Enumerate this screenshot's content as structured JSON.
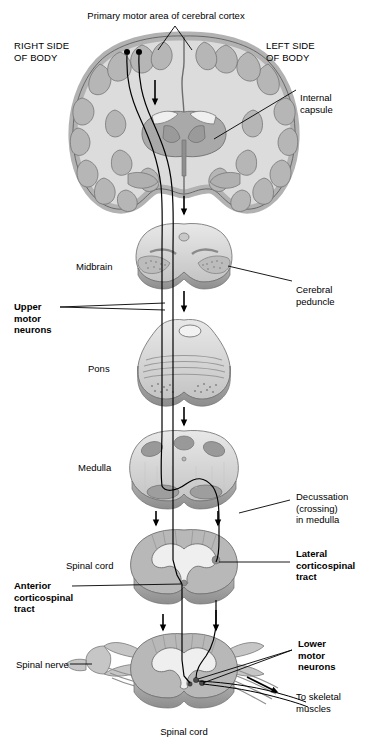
{
  "figure": {
    "title_label": "Primary motor area of cerebral cortex",
    "side_left_label": "RIGHT SIDE\nOF BODY",
    "side_right_label": "LEFT SIDE\nOF BODY",
    "bottom_caption": "Spinal cord"
  },
  "labels": {
    "internal_capsule": "Internal\ncapsule",
    "midbrain": "Midbrain",
    "cerebral_peduncle": "Cerebral\npeduncle",
    "upper_motor_neurons": "Upper\nmotor\nneurons",
    "pons": "Pons",
    "medulla": "Medulla",
    "decussation": "Decussation\n(crossing)\nin medulla",
    "spinal_cord_mid": "Spinal cord",
    "lateral_corticospinal_tract": "Lateral\ncorticospinal\ntract",
    "anterior_corticospinal_tract": "Anterior\ncorticospinal\ntract",
    "spinal_nerve": "Spinal nerve",
    "lower_motor_neurons": "Lower\nmotor\nneurons",
    "to_skeletal_muscles": "To skeletal\nmuscles"
  },
  "colors": {
    "ink": "#000000",
    "white_matter": "#dcdcdc",
    "gray_matter": "#a9a9a9",
    "cortex_band": "#b4b4b4",
    "mid_gray": "#c0c0c0",
    "dark_gray": "#8c8c8c",
    "shadow": "#9a9a9a",
    "highlight": "#efefef",
    "background": "#ffffff"
  },
  "sections": [
    {
      "name": "cerebral-cortex-coronal-section",
      "label": "Primary motor area of cerebral cortex"
    },
    {
      "name": "midbrain-section",
      "label": "Midbrain"
    },
    {
      "name": "pons-section",
      "label": "Pons"
    },
    {
      "name": "medulla-section",
      "label": "Medulla"
    },
    {
      "name": "spinal-cord-upper-section",
      "label": "Spinal cord"
    },
    {
      "name": "spinal-cord-lower-section",
      "label": "Spinal cord"
    }
  ]
}
